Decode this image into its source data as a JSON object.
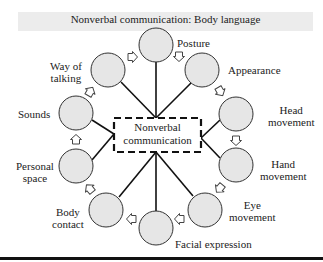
{
  "title": "Nonverbal communication: Body language",
  "center": {
    "line1": "Nonverbal",
    "line2": "communication"
  },
  "nodes": [
    {
      "id": "posture",
      "label1": "Posture",
      "label2": ""
    },
    {
      "id": "appearance",
      "label1": "Appearance",
      "label2": ""
    },
    {
      "id": "head-movement",
      "label1": "Head",
      "label2": "movement"
    },
    {
      "id": "hand-movement",
      "label1": "Hand",
      "label2": "movement"
    },
    {
      "id": "eye-movement",
      "label1": "Eye",
      "label2": "movement"
    },
    {
      "id": "facial-expression",
      "label1": "Facial expression",
      "label2": ""
    },
    {
      "id": "body-contact",
      "label1": "Body",
      "label2": "contact"
    },
    {
      "id": "personal-space",
      "label1": "Personal",
      "label2": "space"
    },
    {
      "id": "sounds",
      "label1": "Sounds",
      "label2": ""
    },
    {
      "id": "way-of-talking",
      "label1": "Way of",
      "label2": "talking"
    }
  ],
  "colors": {
    "circle_fill": "#e6e6e6",
    "stroke": "#222222",
    "banner": "#ececec"
  }
}
